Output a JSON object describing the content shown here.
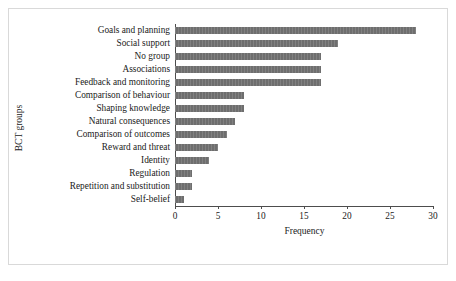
{
  "chart_data": {
    "type": "bar",
    "orientation": "horizontal",
    "title": "",
    "xlabel": "Frequency",
    "ylabel": "BCT groups",
    "xlim": [
      0,
      30
    ],
    "xticks": [
      0,
      5,
      10,
      15,
      20,
      25,
      30
    ],
    "grid": false,
    "legend": false,
    "bar_color": "#6e6e6e",
    "axis_color": "#4d4d4d",
    "frame_color": "#d9d9d9",
    "categories": [
      "Goals and planning",
      "Social support",
      "No group",
      "Associations",
      "Feedback and monitoring",
      "Comparison of behaviour",
      "Shaping knowledge",
      "Natural consequences",
      "Comparison of outcomes",
      "Reward and threat",
      "Identity",
      "Regulation",
      "Repetition and substitution",
      "Self-belief"
    ],
    "values": [
      28,
      19,
      17,
      17,
      17,
      8,
      8,
      7,
      6,
      5,
      4,
      2,
      2,
      1
    ]
  }
}
